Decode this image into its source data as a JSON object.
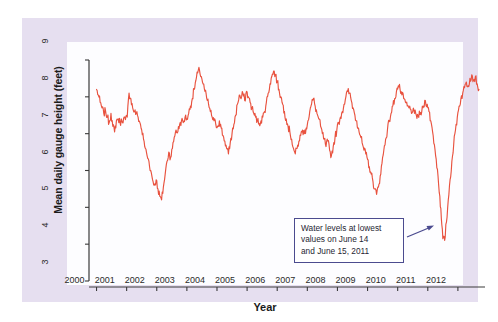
{
  "figure": {
    "panel_background": "#e6dff0",
    "plot_background": "#fdfdff",
    "line_color": "#e8523f",
    "axis_color": "#3a3a3a",
    "annotation_border_color": "#4b4b8f"
  },
  "annotation": {
    "name": "lowest-water-level-callout",
    "lines": [
      "Water levels at lowest",
      "values on June 14",
      "and June 15, 2011"
    ],
    "arrow_target_year": 2011.45,
    "arrow_target_value": 4.1
  },
  "chart_data": {
    "type": "line",
    "title": "",
    "xlabel": "Year",
    "ylabel": "Mean daily gauge height (feet)",
    "xlim": [
      1999.75,
      2012.9
    ],
    "ylim": [
      3,
      9
    ],
    "grid": false,
    "legend": "none",
    "xticks": [
      2000,
      2001,
      2002,
      2003,
      2004,
      2005,
      2006,
      2007,
      2008,
      2009,
      2010,
      2011,
      2012
    ],
    "xtick_labels": [
      "2000",
      "2001",
      "2002",
      "2003",
      "2004",
      "2005",
      "2006",
      "2007",
      "2008",
      "2009",
      "2010",
      "2011",
      "2012"
    ],
    "yticks": [
      3,
      4,
      5,
      6,
      7,
      8,
      9
    ],
    "ytick_labels": [
      "3",
      "4",
      "5",
      "6",
      "7",
      "8",
      "9"
    ],
    "series": [
      {
        "name": "Mean daily gauge height",
        "color": "#e8523f",
        "x": [
          2000.0,
          2000.06,
          2000.12,
          2000.18,
          2000.24,
          2000.3,
          2000.36,
          2000.42,
          2000.48,
          2000.54,
          2000.6,
          2000.66,
          2000.72,
          2000.78,
          2000.84,
          2000.9,
          2000.96,
          2001.02,
          2001.08,
          2001.14,
          2001.2,
          2001.26,
          2001.32,
          2001.38,
          2001.44,
          2001.5,
          2001.56,
          2001.62,
          2001.68,
          2001.74,
          2001.8,
          2001.86,
          2001.92,
          2001.98,
          2002.04,
          2002.1,
          2002.16,
          2002.22,
          2002.28,
          2002.34,
          2002.4,
          2002.46,
          2002.52,
          2002.58,
          2002.64,
          2002.7,
          2002.76,
          2002.82,
          2002.88,
          2002.94,
          2003.0,
          2003.06,
          2003.12,
          2003.18,
          2003.24,
          2003.3,
          2003.36,
          2003.42,
          2003.48,
          2003.54,
          2003.6,
          2003.66,
          2003.72,
          2003.78,
          2003.84,
          2003.9,
          2003.96,
          2004.02,
          2004.08,
          2004.14,
          2004.2,
          2004.26,
          2004.32,
          2004.38,
          2004.44,
          2004.5,
          2004.56,
          2004.62,
          2004.68,
          2004.74,
          2004.8,
          2004.86,
          2004.92,
          2004.98,
          2005.04,
          2005.1,
          2005.16,
          2005.22,
          2005.28,
          2005.34,
          2005.4,
          2005.46,
          2005.52,
          2005.58,
          2005.64,
          2005.7,
          2005.76,
          2005.82,
          2005.88,
          2005.94,
          2006.0,
          2006.06,
          2006.12,
          2006.18,
          2006.24,
          2006.3,
          2006.36,
          2006.42,
          2006.48,
          2006.54,
          2006.6,
          2006.66,
          2006.72,
          2006.78,
          2006.84,
          2006.9,
          2006.96,
          2007.02,
          2007.08,
          2007.14,
          2007.2,
          2007.26,
          2007.32,
          2007.38,
          2007.44,
          2007.5,
          2007.56,
          2007.62,
          2007.68,
          2007.74,
          2007.8,
          2007.86,
          2007.92,
          2007.98,
          2008.04,
          2008.1,
          2008.16,
          2008.22,
          2008.28,
          2008.34,
          2008.4,
          2008.46,
          2008.52,
          2008.58,
          2008.64,
          2008.7,
          2008.76,
          2008.82,
          2008.88,
          2008.94,
          2009.0,
          2009.06,
          2009.12,
          2009.18,
          2009.24,
          2009.3,
          2009.36,
          2009.42,
          2009.48,
          2009.54,
          2009.6,
          2009.66,
          2009.72,
          2009.78,
          2009.84,
          2009.9,
          2009.96,
          2010.02,
          2010.08,
          2010.14,
          2010.2,
          2010.26,
          2010.32,
          2010.38,
          2010.44,
          2010.5,
          2010.56,
          2010.62,
          2010.68,
          2010.74,
          2010.8,
          2010.86,
          2010.92,
          2010.98,
          2011.04,
          2011.1,
          2011.16,
          2011.22,
          2011.28,
          2011.34,
          2011.4,
          2011.45,
          2011.5,
          2011.56,
          2011.62,
          2011.68,
          2011.74,
          2011.8,
          2011.86,
          2011.92,
          2011.98,
          2012.04,
          2012.1,
          2012.16,
          2012.22,
          2012.28,
          2012.34,
          2012.4,
          2012.46,
          2012.52,
          2012.58,
          2012.64,
          2012.7
        ],
        "y": [
          8.2,
          8.05,
          7.85,
          7.7,
          7.55,
          7.62,
          7.45,
          7.3,
          7.55,
          7.2,
          7.05,
          7.35,
          7.4,
          7.3,
          7.35,
          7.42,
          7.38,
          7.45,
          8.1,
          7.95,
          7.7,
          7.6,
          7.55,
          7.45,
          7.3,
          7.1,
          6.85,
          6.6,
          6.4,
          6.25,
          6.0,
          5.75,
          5.6,
          5.75,
          5.5,
          5.3,
          5.2,
          5.55,
          5.9,
          6.25,
          6.5,
          6.35,
          6.6,
          6.9,
          7.1,
          7.05,
          7.25,
          7.35,
          7.3,
          7.45,
          7.4,
          7.55,
          7.75,
          7.95,
          8.2,
          8.45,
          8.65,
          8.72,
          8.55,
          8.35,
          8.15,
          7.95,
          7.8,
          7.6,
          7.45,
          7.35,
          7.25,
          7.2,
          7.35,
          7.15,
          6.95,
          6.8,
          6.6,
          6.45,
          6.75,
          7.0,
          7.25,
          7.5,
          7.8,
          8.05,
          7.95,
          8.1,
          7.9,
          8.15,
          8.0,
          7.85,
          7.7,
          7.55,
          7.45,
          7.35,
          7.28,
          7.35,
          7.45,
          7.6,
          7.85,
          8.1,
          8.35,
          8.55,
          8.7,
          8.6,
          8.4,
          8.2,
          8.0,
          7.8,
          7.6,
          7.4,
          7.2,
          7.05,
          6.85,
          6.6,
          6.45,
          6.6,
          6.8,
          6.95,
          7.1,
          7.0,
          7.15,
          7.35,
          7.6,
          7.8,
          7.95,
          7.75,
          7.55,
          7.4,
          7.2,
          7.0,
          6.85,
          6.65,
          6.8,
          6.55,
          6.4,
          6.65,
          6.9,
          7.1,
          7.3,
          7.45,
          7.6,
          7.8,
          8.0,
          8.15,
          8.1,
          7.9,
          7.7,
          7.5,
          7.35,
          7.15,
          6.95,
          6.75,
          6.55,
          6.45,
          6.3,
          6.1,
          5.9,
          5.7,
          5.5,
          5.35,
          5.55,
          5.85,
          6.2,
          6.55,
          6.85,
          7.1,
          7.35,
          7.55,
          7.75,
          7.95,
          8.15,
          8.3,
          8.2,
          8.05,
          7.95,
          7.85,
          7.75,
          7.7,
          7.65,
          7.6,
          7.55,
          7.5,
          7.48,
          7.52,
          7.6,
          7.75,
          7.9,
          7.8,
          7.6,
          7.35,
          7.05,
          6.7,
          6.3,
          5.85,
          5.3,
          4.7,
          4.15,
          4.1,
          4.6,
          5.2,
          5.75,
          6.25,
          6.7,
          7.1,
          7.45,
          7.75,
          7.95,
          8.1,
          8.25,
          8.4,
          8.3,
          8.5,
          8.6,
          8.45,
          8.55,
          8.35,
          8.2
        ]
      }
    ]
  }
}
